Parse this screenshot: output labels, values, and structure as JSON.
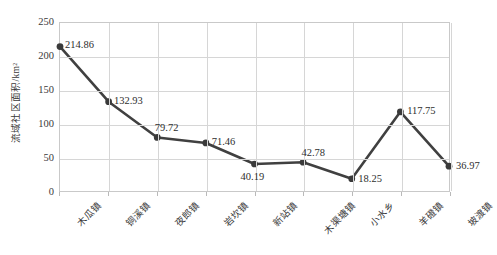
{
  "chart_data": {
    "type": "line",
    "title": "",
    "xlabel": "",
    "ylabel": "流域社区面积/km²",
    "ylim": [
      0,
      250
    ],
    "yticks": [
      0,
      50,
      100,
      150,
      200,
      250
    ],
    "grid": true,
    "legend": "none",
    "marker": "circle",
    "line_color": "#404040",
    "marker_color": "#3a3a3a",
    "grid_color": "#d6d6d6",
    "categories": [
      "木瓜镇",
      "铜溪镇",
      "夜郎镇",
      "岩坎镇",
      "新站镇",
      "木渠塘镇",
      "小水乡",
      "羊磴镇",
      "坡渡镇"
    ],
    "values": [
      214.86,
      132.93,
      79.72,
      71.46,
      40.19,
      42.78,
      18.25,
      117.75,
      36.97
    ],
    "data_labels": [
      "214.86",
      "132.93",
      "79.72",
      "71.46",
      "40.19",
      "42.78",
      "18.25",
      "117.75",
      "36.97"
    ],
    "label_positions": [
      "right",
      "right",
      "above",
      "right",
      "below",
      "above",
      "right",
      "right",
      "right"
    ]
  }
}
